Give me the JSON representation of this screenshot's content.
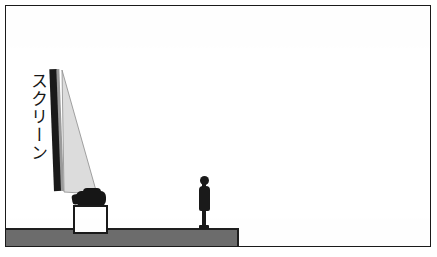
{
  "figure": {
    "type": "line-drawing-illustration",
    "background_color": "#ffffff"
  },
  "labels": {
    "screen_caption": "スクリーン"
  },
  "objects": {
    "frame": {
      "name": "illustration-border",
      "color": "#1a1a1a"
    },
    "screen": {
      "name": "projection-screen",
      "color": "#1a1a1a",
      "edge_color": "#9a9a9a"
    },
    "light_cone": {
      "name": "projection-light-beam",
      "color": "#dcdcdc",
      "outline_color": "#8a8a8a"
    },
    "projector": {
      "name": "projector",
      "color": "#161616"
    },
    "stand": {
      "name": "projector-stand",
      "fill": "#ffffff",
      "outline": "#1a1a1a"
    },
    "person": {
      "name": "standing-person-silhouette",
      "color": "#1a1a1a"
    },
    "platform": {
      "name": "raised-floor-platform",
      "color": "#6d6d6d",
      "outline": "#1f1f1f"
    },
    "ground_line": {
      "name": "floor-line",
      "color": "#1f1f1f"
    }
  }
}
